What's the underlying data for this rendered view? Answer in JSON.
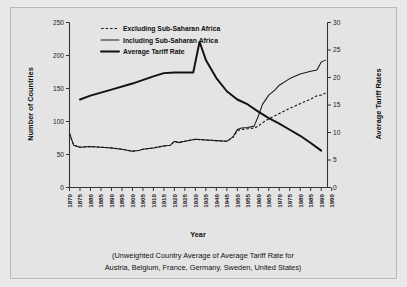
{
  "chart_data": {
    "type": "line",
    "title": "",
    "caption_lines": [
      "(Unweighted Country Average of Average Tariff Rate for",
      "Austria, Belgium, France, Germany, Sweden, United States)"
    ],
    "xlabel": "Year",
    "ylabel": "Number of Countries",
    "y2label": "Average Tariff Rates",
    "ylim": [
      0,
      250
    ],
    "y2lim": [
      0,
      30
    ],
    "xlim": [
      1870,
      1993
    ],
    "yticks": [
      0,
      50,
      100,
      150,
      200,
      250
    ],
    "y2ticks": [
      0,
      5,
      10,
      15,
      20,
      25,
      30
    ],
    "xticklabels": [
      "1870",
      "1875",
      "1880",
      "1885",
      "1890",
      "1895",
      "1900",
      "1905",
      "1910",
      "1915",
      "1920",
      "1925",
      "1930",
      "1935",
      "1940",
      "1945",
      "1950",
      "1955",
      "1960",
      "1965",
      "1970",
      "1975",
      "1980",
      "1985",
      "1990",
      "1990"
    ],
    "grid": false,
    "legend_position": "top-left",
    "legend": [
      {
        "label": "Excluding Sub-Saharan Africa",
        "style": "dashed"
      },
      {
        "label": "Including Sub-Saharan Africa",
        "style": "thin-solid"
      },
      {
        "label": "Average Tariff Rate",
        "style": "thick-solid"
      }
    ],
    "series": [
      {
        "name": "Excluding Sub-Saharan Africa",
        "axis": "left",
        "style": "dashed",
        "x": [
          1870,
          1872,
          1875,
          1880,
          1885,
          1890,
          1895,
          1900,
          1903,
          1905,
          1910,
          1915,
          1918,
          1920,
          1922,
          1925,
          1930,
          1935,
          1940,
          1945,
          1948,
          1950,
          1952,
          1955,
          1958,
          1960,
          1962,
          1965,
          1970,
          1975,
          1980,
          1985,
          1988,
          1990,
          1992
        ],
        "values": [
          82,
          64,
          61,
          62,
          61,
          60,
          58,
          55,
          56,
          58,
          60,
          63,
          64,
          70,
          68,
          70,
          73,
          72,
          71,
          70,
          76,
          86,
          88,
          89,
          90,
          93,
          98,
          104,
          112,
          120,
          127,
          134,
          139,
          140,
          143
        ]
      },
      {
        "name": "Including Sub-Saharan Africa",
        "axis": "left",
        "style": "thin-solid",
        "x": [
          1870,
          1872,
          1875,
          1880,
          1885,
          1890,
          1895,
          1900,
          1903,
          1905,
          1910,
          1915,
          1918,
          1920,
          1922,
          1925,
          1930,
          1935,
          1940,
          1945,
          1948,
          1950,
          1952,
          1955,
          1958,
          1960,
          1962,
          1965,
          1968,
          1970,
          1975,
          1980,
          1985,
          1988,
          1990,
          1992
        ],
        "values": [
          82,
          64,
          61,
          62,
          61,
          60,
          58,
          55,
          56,
          58,
          60,
          63,
          64,
          70,
          68,
          70,
          73,
          72,
          71,
          70,
          77,
          88,
          90,
          91,
          93,
          108,
          126,
          140,
          148,
          155,
          165,
          172,
          176,
          178,
          190,
          193
        ]
      },
      {
        "name": "Average Tariff Rate",
        "axis": "right",
        "style": "thick-solid",
        "x": [
          1875,
          1880,
          1890,
          1900,
          1910,
          1915,
          1920,
          1925,
          1929,
          1932,
          1935,
          1940,
          1945,
          1950,
          1955,
          1960,
          1965,
          1970,
          1975,
          1980,
          1985,
          1990
        ],
        "values": [
          16.0,
          16.7,
          17.8,
          18.9,
          20.2,
          20.8,
          20.9,
          20.9,
          20.9,
          26.5,
          23.2,
          19.9,
          17.5,
          16.0,
          15.1,
          13.8,
          12.6,
          11.6,
          10.5,
          9.4,
          8.1,
          6.7
        ]
      }
    ]
  },
  "axis_titles": {
    "left": "Number of Countries",
    "right": "Average Tariff Rates",
    "bottom": "Year"
  },
  "colors": {
    "background": "#e9e9e9",
    "panel": "#e4e4e4",
    "border": "#b9b9b9",
    "ink": "#1a1a1a"
  }
}
